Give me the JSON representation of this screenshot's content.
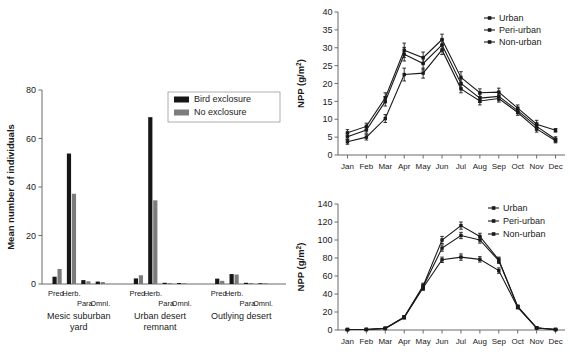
{
  "figure": {
    "panels": [
      "bar-chart-arthropods",
      "npp-line-chart-top",
      "npp-line-chart-bottom"
    ]
  },
  "chart_data": [
    {
      "id": "bar",
      "type": "bar",
      "title": "",
      "xlabel": "",
      "ylabel": "Mean number of individuals",
      "ylim": [
        0,
        80
      ],
      "yticks": [
        0,
        20,
        40,
        60,
        80
      ],
      "ytick_labels": [
        "0",
        "20",
        "40",
        "60",
        "80"
      ],
      "grid": false,
      "legend_position": "top-right",
      "legend": [
        {
          "label": "Bird exclosure",
          "color": "#161616"
        },
        {
          "label": "No exclosure",
          "color": "#7c7c7c"
        }
      ],
      "categories": [
        "Pred.",
        "Herb.",
        "Para.",
        "Omnl."
      ],
      "groups": [
        {
          "label_line1": "Mesic suburban",
          "label_line2": "yard",
          "series": [
            {
              "name": "Bird exclosure",
              "values": [
                3.0,
                53.8,
                1.6,
                1.0
              ]
            },
            {
              "name": "No exclosure",
              "values": [
                6.2,
                37.2,
                1.1,
                0.8
              ]
            }
          ]
        },
        {
          "label_line1": "Urban desert",
          "label_line2": "remnant",
          "series": [
            {
              "name": "Bird exclosure",
              "values": [
                2.3,
                68.8,
                0.5,
                0.4
              ]
            },
            {
              "name": "No exclosure",
              "values": [
                3.6,
                34.5,
                0.4,
                0.3
              ]
            }
          ]
        },
        {
          "label_line1": "Outlying desert",
          "label_line2": "",
          "series": [
            {
              "name": "Bird exclosure",
              "values": [
                2.2,
                4.1,
                0.5,
                0.3
              ]
            },
            {
              "name": "No exclosure",
              "values": [
                1.3,
                3.9,
                0.4,
                0.3
              ]
            }
          ]
        }
      ]
    },
    {
      "id": "npp_top",
      "type": "line",
      "title": "",
      "xlabel": "",
      "ylabel": "NPP (g/m²)",
      "ylabel_base": "NPP (g/m",
      "ylabel_sup": "2",
      "ylabel_tail": ")",
      "ylim": [
        0,
        40
      ],
      "yticks": [
        0,
        5,
        10,
        15,
        20,
        25,
        30,
        35,
        40
      ],
      "ytick_labels": [
        "0",
        "5",
        "10",
        "15",
        "20",
        "25",
        "30",
        "35",
        "40"
      ],
      "grid": false,
      "legend_position": "top-right",
      "x": [
        "Jan",
        "Feb",
        "Mar",
        "Apr",
        "May",
        "Jun",
        "Jul",
        "Aug",
        "Sep",
        "Oct",
        "Nov",
        "Dec"
      ],
      "series": [
        {
          "name": "Urban",
          "values": [
            6.2,
            8.0,
            16.0,
            29.3,
            27.2,
            32.3,
            21.7,
            17.4,
            17.6,
            13.1,
            8.6,
            6.9
          ],
          "errors": [
            0.9,
            0.9,
            1.4,
            2.0,
            1.6,
            1.5,
            1.6,
            1.1,
            1.1,
            0.9,
            1.1,
            0.5
          ]
        },
        {
          "name": "Peri-urban",
          "values": [
            5.1,
            7.0,
            15.0,
            28.2,
            25.6,
            30.8,
            20.0,
            15.9,
            16.4,
            12.4,
            8.0,
            4.4
          ],
          "errors": [
            0.8,
            0.9,
            1.3,
            1.9,
            1.8,
            1.5,
            1.3,
            1.2,
            1.2,
            0.8,
            1.0,
            0.7
          ]
        },
        {
          "name": "Non-urban",
          "values": [
            3.7,
            5.0,
            10.2,
            22.5,
            22.9,
            29.4,
            18.5,
            15.1,
            15.8,
            11.9,
            7.3,
            4.0
          ],
          "errors": [
            0.7,
            0.8,
            1.1,
            1.8,
            1.4,
            1.3,
            1.1,
            1.1,
            1.0,
            0.8,
            0.9,
            0.6
          ]
        }
      ]
    },
    {
      "id": "npp_bottom",
      "type": "line",
      "title": "",
      "xlabel": "",
      "ylabel": "NPP (g/m²)",
      "ylabel_base": "NPP (g/m",
      "ylabel_sup": "2",
      "ylabel_tail": ")",
      "ylim": [
        0,
        140
      ],
      "yticks": [
        0,
        20,
        40,
        60,
        80,
        100,
        120,
        140
      ],
      "ytick_labels": [
        "0",
        "20",
        "40",
        "60",
        "80",
        "100",
        "120",
        "140"
      ],
      "grid": false,
      "legend_position": "top-right",
      "x": [
        "Jan",
        "Feb",
        "Mar",
        "Apr",
        "May",
        "Jun",
        "Jul",
        "Aug",
        "Sep",
        "Oct",
        "Nov",
        "Dec"
      ],
      "series": [
        {
          "name": "Urban",
          "values": [
            0.5,
            0.6,
            2.0,
            14.5,
            49.0,
            100.0,
            116.0,
            104.0,
            78.0,
            26.0,
            2.5,
            0.6
          ],
          "errors": [
            0.3,
            0.3,
            0.5,
            1.5,
            3.0,
            4.0,
            4.0,
            3.5,
            3.0,
            1.5,
            0.6,
            0.3
          ]
        },
        {
          "name": "Peri-urban",
          "values": [
            0.5,
            0.6,
            1.8,
            14.0,
            48.0,
            91.0,
            105.0,
            100.0,
            77.0,
            26.0,
            2.3,
            0.5
          ],
          "errors": [
            0.3,
            0.3,
            0.5,
            1.4,
            3.0,
            3.5,
            3.5,
            3.5,
            3.0,
            1.5,
            0.6,
            0.3
          ]
        },
        {
          "name": "Non-urban",
          "values": [
            0.5,
            0.6,
            1.7,
            13.8,
            47.0,
            78.0,
            81.0,
            78.5,
            66.0,
            25.0,
            2.2,
            0.5
          ],
          "errors": [
            0.3,
            0.3,
            0.5,
            1.4,
            3.0,
            3.0,
            3.5,
            3.0,
            3.0,
            1.5,
            0.6,
            0.3
          ]
        }
      ]
    }
  ]
}
